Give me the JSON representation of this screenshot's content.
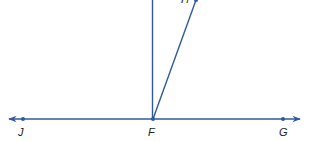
{
  "diagram": {
    "type": "geometry-angles",
    "line_color": "#2f5a9e",
    "label_color": "#222222",
    "points": [
      {
        "id": "J",
        "label": "J"
      },
      {
        "id": "F",
        "label": "F"
      },
      {
        "id": "G",
        "label": "G"
      },
      {
        "id": "H",
        "label": "H"
      }
    ],
    "lines": [
      {
        "name": "line JG",
        "through": [
          "J",
          "F",
          "G"
        ],
        "kind": "line"
      },
      {
        "name": "ray FH",
        "from": "F",
        "through": "H",
        "kind": "ray"
      },
      {
        "name": "vertical segment from F",
        "from": "F",
        "kind": "segment"
      }
    ]
  }
}
